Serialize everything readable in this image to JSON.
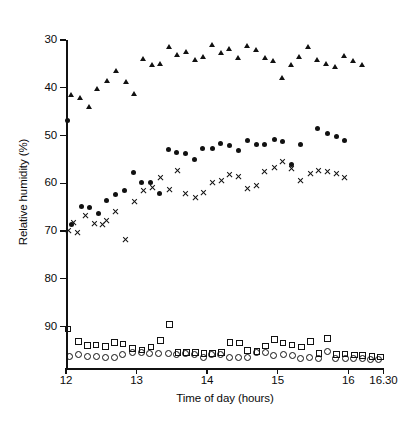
{
  "chart_data": {
    "type": "scatter",
    "title": "",
    "xlabel": "Time of day (hours)",
    "ylabel": "Relative humidity (%)",
    "xlim": [
      12.0,
      16.5
    ],
    "ylim": [
      30,
      97
    ],
    "y_axis_inverted": true,
    "grid": false,
    "legend_position": "none",
    "x_ticks": [
      {
        "value": 12.0,
        "label": "12"
      },
      {
        "value": 13.0,
        "label": "13"
      },
      {
        "value": 14.0,
        "label": "14"
      },
      {
        "value": 15.0,
        "label": "15"
      },
      {
        "value": 16.0,
        "label": "16"
      },
      {
        "value": 16.5,
        "label": "16.30"
      }
    ],
    "y_ticks": [
      {
        "value": 30,
        "label": "30"
      },
      {
        "value": 40,
        "label": "40"
      },
      {
        "value": 50,
        "label": "50"
      },
      {
        "value": 60,
        "label": "60"
      },
      {
        "value": 70,
        "label": "70"
      },
      {
        "value": 80,
        "label": "80"
      },
      {
        "value": 90,
        "label": "90"
      }
    ],
    "series": [
      {
        "name": "series-triangle",
        "marker": "filled-triangle",
        "color": "#111111",
        "points": [
          [
            12.08,
            41.6
          ],
          [
            12.2,
            42.2
          ],
          [
            12.33,
            44.1
          ],
          [
            12.45,
            40.4
          ],
          [
            12.58,
            38.6
          ],
          [
            12.72,
            36.6
          ],
          [
            12.85,
            38.8
          ],
          [
            12.97,
            41.4
          ],
          [
            13.1,
            34.0
          ],
          [
            13.22,
            35.3
          ],
          [
            13.34,
            35.0
          ],
          [
            13.46,
            31.5
          ],
          [
            13.58,
            33.2
          ],
          [
            13.7,
            32.5
          ],
          [
            13.83,
            34.2
          ],
          [
            13.95,
            33.6
          ],
          [
            14.07,
            31.0
          ],
          [
            14.2,
            32.8
          ],
          [
            14.32,
            32.0
          ],
          [
            14.44,
            33.9
          ],
          [
            14.57,
            31.4
          ],
          [
            14.7,
            32.2
          ],
          [
            14.82,
            33.8
          ],
          [
            14.94,
            34.5
          ],
          [
            15.06,
            38.1
          ],
          [
            15.19,
            35.2
          ],
          [
            15.31,
            33.5
          ],
          [
            15.44,
            31.6
          ],
          [
            15.56,
            34.3
          ],
          [
            15.69,
            35.0
          ],
          [
            15.82,
            35.6
          ],
          [
            15.95,
            33.4
          ],
          [
            16.08,
            34.4
          ],
          [
            16.2,
            35.2
          ]
        ]
      },
      {
        "name": "series-filled-circle",
        "marker": "filled-circle",
        "color": "#111111",
        "points": [
          [
            12.02,
            46.8
          ],
          [
            12.08,
            68.7
          ],
          [
            12.22,
            64.9
          ],
          [
            12.34,
            65.1
          ],
          [
            12.46,
            66.3
          ],
          [
            12.58,
            63.6
          ],
          [
            12.7,
            62.3
          ],
          [
            12.83,
            61.6
          ],
          [
            12.95,
            57.8
          ],
          [
            13.07,
            59.8
          ],
          [
            13.2,
            59.8
          ],
          [
            13.33,
            62.2
          ],
          [
            13.45,
            53.0
          ],
          [
            13.57,
            53.6
          ],
          [
            13.7,
            53.7
          ],
          [
            13.82,
            55.0
          ],
          [
            13.94,
            52.7
          ],
          [
            14.07,
            52.7
          ],
          [
            14.19,
            51.6
          ],
          [
            14.32,
            52.1
          ],
          [
            14.44,
            53.2
          ],
          [
            14.57,
            51.0
          ],
          [
            14.7,
            51.9
          ],
          [
            14.82,
            51.9
          ],
          [
            14.95,
            50.8
          ],
          [
            15.07,
            51.2
          ],
          [
            15.2,
            56.0
          ],
          [
            15.33,
            51.9
          ],
          [
            15.57,
            48.5
          ],
          [
            15.7,
            49.6
          ],
          [
            15.83,
            50.2
          ],
          [
            15.95,
            51.1
          ]
        ]
      },
      {
        "name": "series-cross",
        "marker": "cross",
        "color": "#111111",
        "points": [
          [
            12.04,
            69.9
          ],
          [
            12.1,
            68.3
          ],
          [
            12.16,
            70.3
          ],
          [
            12.28,
            66.8
          ],
          [
            12.4,
            68.5
          ],
          [
            12.52,
            68.6
          ],
          [
            12.58,
            67.8
          ],
          [
            12.7,
            65.9
          ],
          [
            12.85,
            71.7
          ],
          [
            12.97,
            63.8
          ],
          [
            13.1,
            61.6
          ],
          [
            13.22,
            60.9
          ],
          [
            13.34,
            58.8
          ],
          [
            13.46,
            61.3
          ],
          [
            13.58,
            57.3
          ],
          [
            13.7,
            62.2
          ],
          [
            13.83,
            62.9
          ],
          [
            13.95,
            62.0
          ],
          [
            14.07,
            59.8
          ],
          [
            14.2,
            59.4
          ],
          [
            14.32,
            58.2
          ],
          [
            14.44,
            58.5
          ],
          [
            14.57,
            61.0
          ],
          [
            14.7,
            60.4
          ],
          [
            14.82,
            57.5
          ],
          [
            14.95,
            56.8
          ],
          [
            15.07,
            55.5
          ],
          [
            15.2,
            57.0
          ],
          [
            15.33,
            59.4
          ],
          [
            15.46,
            58.0
          ],
          [
            15.58,
            57.4
          ],
          [
            15.7,
            57.6
          ],
          [
            15.83,
            58.0
          ],
          [
            15.95,
            58.9
          ]
        ]
      },
      {
        "name": "series-open-square",
        "marker": "open-square",
        "color": "#111111",
        "points": [
          [
            12.02,
            90.4
          ],
          [
            12.17,
            93.1
          ],
          [
            12.3,
            93.9
          ],
          [
            12.42,
            93.8
          ],
          [
            12.55,
            94.1
          ],
          [
            12.68,
            93.3
          ],
          [
            12.8,
            93.6
          ],
          [
            12.94,
            94.5
          ],
          [
            13.07,
            94.8
          ],
          [
            13.2,
            94.2
          ],
          [
            13.33,
            92.9
          ],
          [
            13.46,
            89.5
          ],
          [
            13.58,
            95.4
          ],
          [
            13.7,
            95.3
          ],
          [
            13.83,
            95.4
          ],
          [
            13.95,
            95.6
          ],
          [
            14.07,
            95.6
          ],
          [
            14.2,
            95.4
          ],
          [
            14.32,
            93.3
          ],
          [
            14.45,
            93.4
          ],
          [
            14.57,
            95.0
          ],
          [
            14.7,
            95.1
          ],
          [
            14.82,
            94.0
          ],
          [
            14.95,
            92.6
          ],
          [
            15.07,
            93.4
          ],
          [
            15.2,
            93.8
          ],
          [
            15.33,
            94.2
          ],
          [
            15.46,
            93.1
          ],
          [
            15.58,
            95.6
          ],
          [
            15.7,
            92.4
          ],
          [
            15.83,
            95.8
          ],
          [
            15.95,
            95.7
          ],
          [
            16.08,
            95.9
          ],
          [
            16.2,
            96.0
          ],
          [
            16.33,
            96.2
          ],
          [
            16.45,
            96.3
          ]
        ]
      },
      {
        "name": "series-open-circle",
        "marker": "open-circle",
        "color": "#111111",
        "points": [
          [
            12.05,
            96.3
          ],
          [
            12.17,
            95.8
          ],
          [
            12.3,
            96.1
          ],
          [
            12.42,
            96.3
          ],
          [
            12.55,
            96.4
          ],
          [
            12.68,
            96.4
          ],
          [
            12.8,
            95.7
          ],
          [
            12.93,
            95.4
          ],
          [
            13.06,
            95.4
          ],
          [
            13.18,
            95.6
          ],
          [
            13.31,
            95.6
          ],
          [
            13.44,
            95.5
          ],
          [
            13.56,
            95.7
          ],
          [
            13.69,
            95.6
          ],
          [
            13.81,
            95.7
          ],
          [
            13.94,
            96.4
          ],
          [
            14.06,
            95.8
          ],
          [
            14.19,
            95.7
          ],
          [
            14.31,
            96.4
          ],
          [
            14.44,
            96.5
          ],
          [
            14.57,
            96.5
          ],
          [
            14.7,
            95.3
          ],
          [
            14.82,
            95.4
          ],
          [
            14.94,
            95.9
          ],
          [
            15.07,
            95.8
          ],
          [
            15.2,
            96.0
          ],
          [
            15.32,
            96.6
          ],
          [
            15.45,
            96.5
          ],
          [
            15.57,
            96.6
          ],
          [
            15.7,
            95.2
          ],
          [
            15.82,
            96.6
          ],
          [
            15.95,
            96.7
          ],
          [
            16.07,
            96.7
          ],
          [
            16.19,
            96.7
          ],
          [
            16.31,
            96.8
          ],
          [
            16.43,
            96.8
          ]
        ]
      }
    ]
  }
}
